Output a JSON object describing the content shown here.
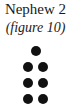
{
  "figure": {
    "title": "Nephew 2",
    "caption": "(figure 10)"
  },
  "pattern": {
    "description": "dot pattern: 1 dot on top, then 3 rows of 2 dots",
    "dot_color": "#111111",
    "rows": [
      1,
      2,
      2,
      2
    ],
    "dots": [
      {
        "row": 1,
        "cx": 36,
        "cy": 51
      },
      {
        "row": 2,
        "cx": 28,
        "cy": 67
      },
      {
        "row": 2,
        "cx": 43,
        "cy": 67
      },
      {
        "row": 3,
        "cx": 28,
        "cy": 83
      },
      {
        "row": 3,
        "cx": 43,
        "cy": 83
      },
      {
        "row": 4,
        "cx": 28,
        "cy": 99
      },
      {
        "row": 4,
        "cx": 43,
        "cy": 99
      }
    ]
  }
}
